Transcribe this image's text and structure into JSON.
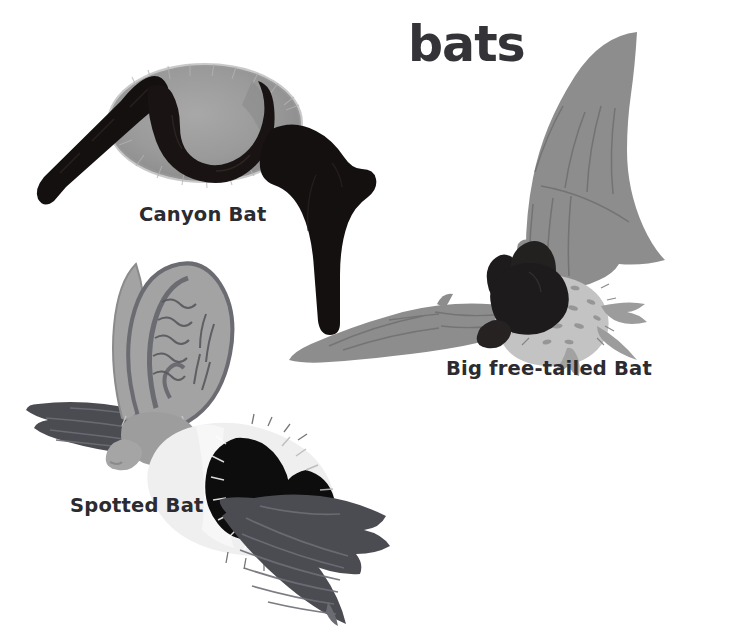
{
  "page": {
    "title": "bats",
    "background_color": "#ffffff",
    "width": 736,
    "height": 634
  },
  "figures": [
    {
      "id": "canyon-bat",
      "caption": "Canyon Bat",
      "body_color": "#9a9a9a",
      "wing_color": "#14100f",
      "description": "gray furred oval body with black wings spread left and hanging right"
    },
    {
      "id": "big-free-tailed-bat",
      "caption": "Big free-tailed Bat",
      "body_color": "#c3c3c3",
      "wing_color": "#8d8d8d",
      "head_color": "#1d1b1b",
      "description": "light gray speckled body, dark head and ears, one wing raised high, one wing spread left, free tail at right"
    },
    {
      "id": "spotted-bat",
      "caption": "Spotted Bat",
      "body_color": "#eeeeee",
      "spot_color": "#0d0d0d",
      "ear_color": "#a3a3a3",
      "wing_color": "#4b4b52",
      "description": "huge upright ears, white and black spotted body, dark gray wings spread left and down-right"
    }
  ],
  "colors": {
    "text": "#2b2b30",
    "title": "#333338",
    "mid_gray": "#8d8d8d",
    "dark_gray": "#4b4b52",
    "black": "#14100f",
    "light_gray": "#c3c3c3"
  }
}
